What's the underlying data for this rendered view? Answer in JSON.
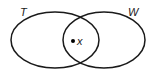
{
  "diagram": {
    "type": "venn",
    "sets": [
      {
        "id": "T",
        "label": "T",
        "cx": 55,
        "cy": 40,
        "rx": 44,
        "ry": 28,
        "label_x": 20,
        "label_y": 16
      },
      {
        "id": "W",
        "label": "W",
        "cx": 104,
        "cy": 40,
        "rx": 41,
        "ry": 28,
        "label_x": 128,
        "label_y": 16
      }
    ],
    "elements": [
      {
        "label": "x",
        "region": "T ∩ W",
        "dot_x": 73,
        "dot_y": 41,
        "label_x": 77,
        "label_y": 45
      }
    ],
    "colors": {
      "stroke": "#1a1a1a",
      "background": "#ffffff",
      "dot": "#000000"
    }
  }
}
